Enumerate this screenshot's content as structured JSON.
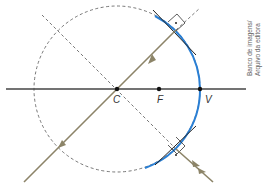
{
  "diagram": {
    "type": "concave spherical mirror ray diagram",
    "points": {
      "center": "C",
      "focus": "F",
      "vertex": "V"
    },
    "credit": {
      "line1": "Banco de imagens/",
      "line2": "Arquivo da editora"
    },
    "colors": {
      "mirror": "#2a7fd4",
      "ray": "#8c8468",
      "axis": "#333333",
      "dashed": "#555555",
      "background": "#ffffff"
    }
  }
}
